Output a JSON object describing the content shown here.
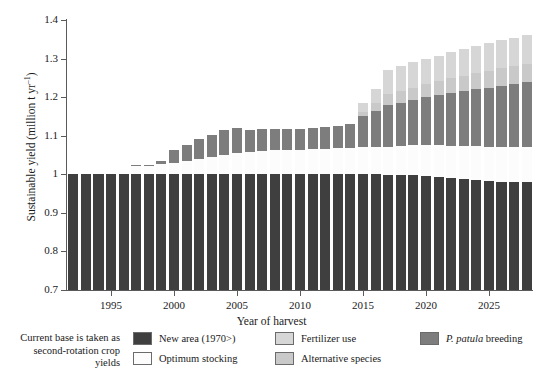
{
  "chart_data": {
    "type": "bar",
    "stacked": true,
    "title": "",
    "xlabel": "Year of harvest",
    "ylabel": "Sustainable yield (million t yr⁻¹)",
    "ylim": [
      0.7,
      1.4
    ],
    "ytick_labels": [
      "0.7",
      "0.8",
      "0.9",
      "1",
      "1.1",
      "1.2",
      "1.3",
      "1.4"
    ],
    "ytick_values": [
      0.7,
      0.8,
      0.9,
      1.0,
      1.1,
      1.2,
      1.3,
      1.4
    ],
    "xtick_labels": [
      "1995",
      "2000",
      "2005",
      "2010",
      "2015",
      "2020",
      "2025"
    ],
    "xtick_values": [
      1995,
      2000,
      2005,
      2010,
      2015,
      2020,
      2025
    ],
    "grid": false,
    "legend_position": "bottom",
    "x": [
      1992,
      1993,
      1994,
      1995,
      1996,
      1997,
      1998,
      1999,
      2000,
      2001,
      2002,
      2003,
      2004,
      2005,
      2006,
      2007,
      2008,
      2009,
      2010,
      2011,
      2012,
      2013,
      2014,
      2015,
      2016,
      2017,
      2018,
      2019,
      2020,
      2021,
      2022,
      2023,
      2024,
      2025,
      2026,
      2027,
      2028
    ],
    "series": [
      {
        "name": "New area (1970>)",
        "color": "#3f3f3f",
        "values": [
          1.0,
          1.0,
          1.0,
          1.0,
          1.0,
          1.0,
          1.0,
          1.0,
          1.0,
          1.0,
          1.0,
          1.0,
          1.0,
          1.0,
          1.0,
          1.0,
          1.0,
          1.0,
          1.0,
          1.0,
          1.0,
          1.0,
          1.0,
          1.0,
          1.0,
          0.998,
          0.998,
          0.997,
          0.995,
          0.993,
          0.99,
          0.988,
          0.985,
          0.982,
          0.98,
          0.98,
          0.98
        ]
      },
      {
        "name": "Optimum stocking",
        "color": "#fcfcfc",
        "values": [
          0.0,
          0.0,
          0.0,
          0.0,
          0.0,
          0.022,
          0.022,
          0.026,
          0.03,
          0.035,
          0.04,
          0.045,
          0.05,
          0.055,
          0.058,
          0.06,
          0.062,
          0.063,
          0.064,
          0.065,
          0.066,
          0.067,
          0.068,
          0.07,
          0.072,
          0.074,
          0.076,
          0.078,
          0.08,
          0.082,
          0.084,
          0.086,
          0.088,
          0.09,
          0.092,
          0.092,
          0.092
        ]
      },
      {
        "name": "P. patula breeding",
        "color": "#7d7d7d",
        "values": [
          0.0,
          0.0,
          0.0,
          0.0,
          0.0,
          0.003,
          0.003,
          0.008,
          0.032,
          0.04,
          0.052,
          0.058,
          0.064,
          0.065,
          0.056,
          0.057,
          0.056,
          0.055,
          0.054,
          0.055,
          0.056,
          0.057,
          0.062,
          0.08,
          0.093,
          0.108,
          0.112,
          0.118,
          0.125,
          0.13,
          0.137,
          0.142,
          0.147,
          0.153,
          0.158,
          0.162,
          0.168
        ]
      },
      {
        "name": "Alternative species",
        "color": "#c9c9c9",
        "values": [
          0.0,
          0.0,
          0.0,
          0.0,
          0.0,
          0.0,
          0.0,
          0.0,
          0.0,
          0.0,
          0.0,
          0.0,
          0.0,
          0.0,
          0.0,
          0.0,
          0.0,
          0.0,
          0.0,
          0.0,
          0.0,
          0.0,
          0.0,
          0.012,
          0.02,
          0.028,
          0.03,
          0.032,
          0.034,
          0.036,
          0.038,
          0.04,
          0.042,
          0.043,
          0.045,
          0.046,
          0.047
        ]
      },
      {
        "name": "Fertilizer use",
        "color": "#d6d6d6",
        "values": [
          0.0,
          0.0,
          0.0,
          0.0,
          0.0,
          0.0,
          0.0,
          0.0,
          0.0,
          0.0,
          0.0,
          0.0,
          0.0,
          0.0,
          0.0,
          0.0,
          0.0,
          0.0,
          0.0,
          0.0,
          0.0,
          0.0,
          0.0,
          0.023,
          0.035,
          0.062,
          0.064,
          0.065,
          0.066,
          0.067,
          0.068,
          0.069,
          0.07,
          0.072,
          0.073,
          0.074,
          0.075
        ]
      }
    ],
    "totals": [
      1.0,
      1.0,
      1.0,
      1.0,
      1.0,
      1.025,
      1.025,
      1.034,
      1.062,
      1.075,
      1.092,
      1.1,
      1.114,
      1.19,
      1.114,
      1.117,
      1.118,
      1.118,
      1.118,
      1.12,
      1.122,
      1.124,
      1.13,
      1.185,
      1.22,
      1.27,
      1.28,
      1.29,
      1.3,
      1.308,
      1.317,
      1.325,
      1.332,
      1.34,
      1.348,
      1.354,
      1.362
    ]
  },
  "legend": {
    "note": "Current base is taken as second-rotation crop yields",
    "items": [
      {
        "label": "New area (1970>)",
        "color": "#3f3f3f",
        "italic_prefix": ""
      },
      {
        "label": "Optimum stocking",
        "color": "#fcfcfc",
        "italic_prefix": ""
      },
      {
        "label": "Fertilizer use",
        "color": "#d6d6d6",
        "italic_prefix": ""
      },
      {
        "label": "Alternative species",
        "color": "#c9c9c9",
        "italic_prefix": ""
      },
      {
        "label": " breeding",
        "color": "#7d7d7d",
        "italic_prefix": "P. patula"
      }
    ]
  },
  "axes": {
    "y_title": "Sustainable yield (million t yr",
    "y_title_sup": "–1",
    "y_title_tail": ")",
    "x_title": "Year of harvest"
  }
}
